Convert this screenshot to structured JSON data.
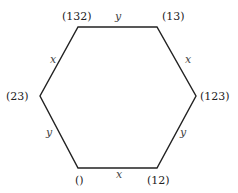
{
  "diagram": {
    "type": "hexagon-cayley-graph",
    "vertices": [
      {
        "id": "v_132",
        "label": "(132)",
        "x": 78,
        "y": 27,
        "lx": 62,
        "ly": 20
      },
      {
        "id": "v_13",
        "label": "(13)",
        "x": 157,
        "y": 27,
        "lx": 162,
        "ly": 20
      },
      {
        "id": "v_123",
        "label": "(123)",
        "x": 196,
        "y": 96,
        "lx": 200,
        "ly": 100
      },
      {
        "id": "v_12",
        "label": "(12)",
        "x": 157,
        "y": 168,
        "lx": 147,
        "ly": 184
      },
      {
        "id": "v_e",
        "label": "()",
        "x": 78,
        "y": 168,
        "lx": 75,
        "ly": 184
      },
      {
        "id": "v_23",
        "label": "(23)",
        "x": 40,
        "y": 96,
        "lx": 6,
        "ly": 100
      }
    ],
    "edges": [
      {
        "from": "v_132",
        "to": "v_13",
        "label": "y",
        "lx": 115,
        "ly": 20
      },
      {
        "from": "v_13",
        "to": "v_123",
        "label": "x",
        "lx": 185,
        "ly": 63
      },
      {
        "from": "v_123",
        "to": "v_12",
        "label": "y",
        "lx": 180,
        "ly": 136
      },
      {
        "from": "v_12",
        "to": "v_e",
        "label": "x",
        "lx": 116,
        "ly": 178
      },
      {
        "from": "v_e",
        "to": "v_23",
        "label": "y",
        "lx": 46,
        "ly": 136
      },
      {
        "from": "v_23",
        "to": "v_132",
        "label": "x",
        "lx": 50,
        "ly": 63
      }
    ]
  }
}
